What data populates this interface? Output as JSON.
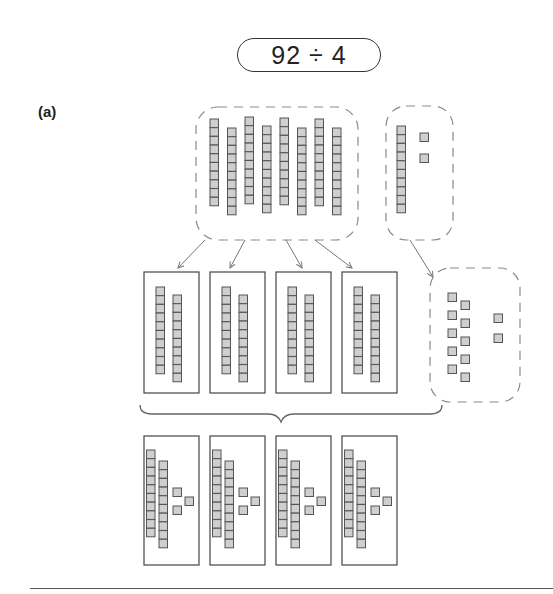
{
  "equation": {
    "dividend": 92,
    "divisor": 4,
    "text": "92 ÷ 4"
  },
  "part_label": "(a)",
  "colors": {
    "unit_fill": "#cfcfcf",
    "unit_stroke": "#555555",
    "box_stroke": "#444444",
    "dashed_stroke": "#8a8a8a",
    "arrow": "#777777"
  },
  "model": {
    "tens_group": {
      "rods": 8,
      "value": 80
    },
    "remainder_group": {
      "rods": 1,
      "units": 2,
      "value": 12
    },
    "regrouped_units": {
      "units_from_rod": 10,
      "extra_units": 2
    },
    "shares": [
      {
        "rods": 2,
        "units": 0
      },
      {
        "rods": 2,
        "units": 0
      },
      {
        "rods": 2,
        "units": 0
      },
      {
        "rods": 2,
        "units": 0
      }
    ],
    "final_shares": [
      {
        "rods": 2,
        "units": 3
      },
      {
        "rods": 2,
        "units": 3
      },
      {
        "rods": 2,
        "units": 3
      },
      {
        "rods": 2,
        "units": 3
      }
    ],
    "quotient_per_share": 23
  }
}
